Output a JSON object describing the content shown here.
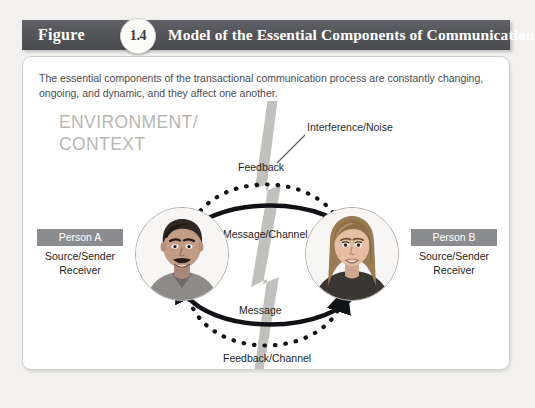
{
  "figure": {
    "word": "Figure",
    "number": "1.4",
    "title": "Model of the Essential Components of Communication",
    "header_bg": "#55565a",
    "badge_text_color": "#3b3c40"
  },
  "panel": {
    "intro": "The essential components of the transactional communication process are constantly changing, ongoing, and dynamic, and they affect one another."
  },
  "diagram": {
    "environment_label_line1": "ENVIRONMENT/",
    "environment_label_line2": "CONTEXT",
    "environment_color": "#b8b7b3",
    "noise_label": "Interference/Noise",
    "noise_color": "#b4b3af",
    "arcs": [
      {
        "name": "feedback",
        "label": "Feedback",
        "style": "dotted",
        "direction": "right-to-left",
        "position": "top-outer"
      },
      {
        "name": "message-channel",
        "label": "Message/Channel",
        "style": "solid",
        "direction": "left-to-right",
        "position": "top-inner"
      },
      {
        "name": "message",
        "label": "Message",
        "style": "solid",
        "direction": "right-to-left",
        "position": "bottom-inner"
      },
      {
        "name": "feedback-channel",
        "label": "Feedback/Channel",
        "style": "dotted",
        "direction": "left-to-right",
        "position": "bottom-outer"
      }
    ],
    "person_a": {
      "badge": "Person A",
      "role_line1": "Source/Sender",
      "role_line2": "Receiver",
      "portrait_alt": "smiling-man-with-mustache"
    },
    "person_b": {
      "badge": "Person B",
      "role_line1": "Source/Sender",
      "role_line2": "Receiver",
      "portrait_alt": "smiling-woman-long-hair"
    },
    "badge_bg": "#8b8c90"
  }
}
